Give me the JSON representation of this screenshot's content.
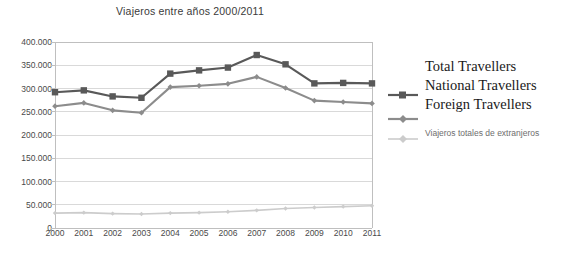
{
  "chart_data": {
    "type": "line",
    "title": "Viajeros entre años 2000/2011",
    "xlabel": "",
    "ylabel": "",
    "grid": true,
    "legend_position": "right",
    "categories": [
      "2000",
      "2001",
      "2002",
      "2003",
      "2004",
      "2005",
      "2006",
      "2007",
      "2008",
      "2009",
      "2010",
      "2011"
    ],
    "x": [
      2000,
      2001,
      2002,
      2003,
      2004,
      2005,
      2006,
      2007,
      2008,
      2009,
      2010,
      2011
    ],
    "ylim": [
      0,
      400000
    ],
    "yticks": [
      0,
      50000,
      100000,
      150000,
      200000,
      250000,
      300000,
      350000,
      400000
    ],
    "ytick_labels": [
      "0",
      "50.000",
      "100.000",
      "150.000",
      "200.000",
      "250.000",
      "300.000",
      "350.000",
      "400.000"
    ],
    "series": [
      {
        "name": "Total Travellers",
        "name_es": "Viajeros totales",
        "color": "#595959",
        "marker": "square",
        "values": [
          292000,
          296000,
          283000,
          280000,
          332000,
          339000,
          345000,
          372000,
          352000,
          311000,
          312000,
          311000
        ]
      },
      {
        "name": "National Travellers",
        "name_es": "Viajeros totales de nacionales",
        "color": "#8c8c8c",
        "marker": "diamond",
        "values": [
          262000,
          269000,
          253000,
          248000,
          303000,
          306000,
          310000,
          325000,
          301000,
          274000,
          271000,
          268000
        ]
      },
      {
        "name": "Foreign Travellers",
        "name_es": "Viajeros totales de extranjeros",
        "color": "#cccccc",
        "marker": "diamond",
        "values": [
          32000,
          33000,
          31000,
          30000,
          32000,
          33000,
          35000,
          38000,
          42000,
          44000,
          46000,
          48000
        ]
      }
    ]
  },
  "legend": {
    "entries_en": [
      {
        "label": "Total Travellers"
      },
      {
        "label": "National Travellers"
      },
      {
        "label": "Foreign Travellers"
      }
    ],
    "entries_es": [
      {
        "label": "Viajeros totales de extranjeros"
      }
    ]
  },
  "colors": {
    "series1": "#595959",
    "series2": "#8c8c8c",
    "series3": "#cccccc",
    "grid": "#d9d9d9",
    "axis": "#bfbfbf",
    "text": "#4a4a4a"
  }
}
